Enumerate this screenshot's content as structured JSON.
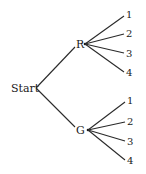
{
  "diagram": {
    "type": "tree",
    "root": {
      "label": "Start",
      "children": [
        {
          "label": "R",
          "children": [
            {
              "label": "1"
            },
            {
              "label": "2"
            },
            {
              "label": "3"
            },
            {
              "label": "4"
            }
          ]
        },
        {
          "label": "G",
          "children": [
            {
              "label": "1"
            },
            {
              "label": "2"
            },
            {
              "label": "3"
            },
            {
              "label": "4"
            }
          ]
        }
      ]
    }
  }
}
